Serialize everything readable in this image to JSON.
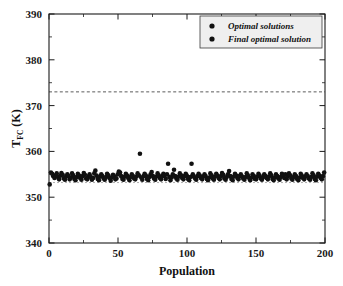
{
  "chart_data": {
    "type": "scatter",
    "title": "",
    "xlabel": "Population",
    "ylabel_main": "T",
    "ylabel_sub": "FC",
    "ylabel_unit": " (K)",
    "ylabel_full": "T_FC (K)",
    "xlim": [
      0,
      200
    ],
    "ylim": [
      340,
      390
    ],
    "xticks": [
      0,
      50,
      100,
      150,
      200
    ],
    "xtick_labels": [
      "0",
      "50",
      "100",
      "150",
      "200"
    ],
    "xticks_minor": [
      25,
      75,
      125,
      175
    ],
    "yticks": [
      340,
      350,
      360,
      370,
      380,
      390
    ],
    "ytick_labels": [
      "340",
      "350",
      "360",
      "370",
      "380",
      "390"
    ],
    "yticks_minor": [
      345,
      355,
      365,
      375,
      385
    ],
    "grid": false,
    "legend_position": "top-right",
    "legend": [
      {
        "label": "Optimal solutions",
        "marker": "filled-circle",
        "color": "#111111"
      },
      {
        "label": "Final optimal solution",
        "marker": "filled-circle",
        "color": "#111111"
      }
    ],
    "reference_lines": [
      {
        "name": "upper-constraint",
        "y": 373.0,
        "style": "dashed",
        "color": "#4a4a4a"
      },
      {
        "name": "final-optimal-solution",
        "y": 353.2,
        "style": "dashed",
        "color": "#9a9a9a"
      }
    ],
    "series": [
      {
        "name": "Optimal solutions",
        "color": "#111111",
        "marker": "filled-circle",
        "points": [
          [
            0.5,
            352.8
          ],
          [
            1.4,
            355.4
          ],
          [
            2.3,
            355.1
          ],
          [
            3.1,
            354.6
          ],
          [
            4.0,
            354.2
          ],
          [
            4.8,
            354.8
          ],
          [
            5.6,
            355.2
          ],
          [
            6.5,
            354.4
          ],
          [
            7.3,
            353.9
          ],
          [
            8.2,
            354.7
          ],
          [
            9.0,
            355.3
          ],
          [
            9.9,
            354.9
          ],
          [
            10.7,
            354.1
          ],
          [
            11.6,
            353.8
          ],
          [
            12.4,
            354.5
          ],
          [
            13.3,
            355.0
          ],
          [
            14.1,
            354.6
          ],
          [
            15.0,
            353.9
          ],
          [
            15.8,
            354.3
          ],
          [
            16.7,
            355.2
          ],
          [
            17.5,
            354.8
          ],
          [
            18.4,
            354.0
          ],
          [
            19.2,
            353.7
          ],
          [
            20.1,
            354.4
          ],
          [
            20.9,
            355.1
          ],
          [
            21.8,
            354.7
          ],
          [
            22.6,
            354.2
          ],
          [
            23.5,
            353.8
          ],
          [
            24.3,
            354.6
          ],
          [
            25.2,
            355.3
          ],
          [
            26.0,
            354.9
          ],
          [
            26.9,
            354.1
          ],
          [
            27.7,
            353.9
          ],
          [
            28.6,
            354.5
          ],
          [
            29.4,
            355.0
          ],
          [
            30.3,
            354.4
          ],
          [
            31.1,
            353.8
          ],
          [
            32.0,
            354.2
          ],
          [
            32.8,
            355.2
          ],
          [
            33.6,
            355.8
          ],
          [
            34.5,
            354.7
          ],
          [
            35.3,
            354.0
          ],
          [
            36.2,
            353.7
          ],
          [
            37.0,
            354.5
          ],
          [
            37.9,
            355.0
          ],
          [
            38.7,
            354.6
          ],
          [
            39.6,
            354.1
          ],
          [
            40.4,
            353.8
          ],
          [
            41.3,
            354.4
          ],
          [
            42.1,
            355.1
          ],
          [
            43.0,
            354.8
          ],
          [
            43.8,
            354.2
          ],
          [
            44.7,
            353.6
          ],
          [
            45.5,
            354.3
          ],
          [
            46.4,
            354.9
          ],
          [
            47.2,
            354.5
          ],
          [
            48.1,
            353.9
          ],
          [
            48.9,
            354.1
          ],
          [
            49.8,
            355.0
          ],
          [
            50.6,
            355.6
          ],
          [
            51.5,
            355.4
          ],
          [
            52.3,
            354.6
          ],
          [
            53.2,
            354.0
          ],
          [
            54.0,
            353.8
          ],
          [
            54.9,
            354.5
          ],
          [
            55.7,
            355.1
          ],
          [
            56.6,
            354.7
          ],
          [
            57.4,
            354.2
          ],
          [
            58.3,
            353.7
          ],
          [
            59.1,
            354.4
          ],
          [
            60.0,
            355.0
          ],
          [
            60.8,
            354.6
          ],
          [
            61.7,
            354.1
          ],
          [
            62.5,
            353.9
          ],
          [
            63.4,
            354.5
          ],
          [
            64.2,
            355.2
          ],
          [
            65.1,
            354.8
          ],
          [
            65.9,
            359.5
          ],
          [
            66.8,
            354.3
          ],
          [
            67.6,
            353.8
          ],
          [
            68.5,
            354.6
          ],
          [
            69.3,
            355.1
          ],
          [
            70.2,
            354.7
          ],
          [
            71.0,
            354.0
          ],
          [
            71.9,
            353.7
          ],
          [
            72.7,
            354.4
          ],
          [
            73.6,
            355.0
          ],
          [
            74.4,
            355.5
          ],
          [
            75.3,
            354.6
          ],
          [
            76.1,
            354.1
          ],
          [
            77.0,
            353.8
          ],
          [
            77.8,
            354.5
          ],
          [
            78.7,
            355.2
          ],
          [
            79.5,
            354.8
          ],
          [
            80.4,
            354.2
          ],
          [
            81.2,
            353.9
          ],
          [
            82.1,
            354.6
          ],
          [
            82.9,
            355.1
          ],
          [
            83.8,
            354.7
          ],
          [
            84.6,
            354.0
          ],
          [
            85.5,
            355.0
          ],
          [
            86.3,
            357.3
          ],
          [
            87.2,
            354.4
          ],
          [
            88.0,
            353.7
          ],
          [
            88.9,
            354.3
          ],
          [
            89.7,
            355.0
          ],
          [
            90.6,
            356.0
          ],
          [
            91.4,
            354.6
          ],
          [
            92.3,
            354.1
          ],
          [
            93.1,
            353.8
          ],
          [
            94.0,
            354.5
          ],
          [
            94.8,
            355.2
          ],
          [
            95.7,
            354.8
          ],
          [
            96.5,
            354.2
          ],
          [
            97.4,
            353.9
          ],
          [
            98.2,
            354.6
          ],
          [
            99.1,
            355.1
          ],
          [
            99.9,
            354.7
          ],
          [
            100.8,
            354.0
          ],
          [
            101.6,
            353.7
          ],
          [
            102.5,
            354.4
          ],
          [
            103.3,
            357.3
          ],
          [
            104.2,
            355.0
          ],
          [
            105.0,
            354.5
          ],
          [
            105.9,
            354.1
          ],
          [
            106.7,
            353.8
          ],
          [
            107.6,
            354.6
          ],
          [
            108.4,
            355.1
          ],
          [
            109.3,
            354.7
          ],
          [
            110.1,
            354.2
          ],
          [
            111.0,
            353.9
          ],
          [
            111.8,
            354.5
          ],
          [
            112.7,
            355.0
          ],
          [
            113.5,
            354.6
          ],
          [
            114.4,
            354.0
          ],
          [
            115.2,
            353.7
          ],
          [
            116.1,
            354.3
          ],
          [
            116.9,
            355.2
          ],
          [
            117.8,
            354.8
          ],
          [
            118.6,
            354.1
          ],
          [
            119.5,
            353.8
          ],
          [
            120.3,
            354.5
          ],
          [
            121.2,
            355.1
          ],
          [
            122.0,
            354.7
          ],
          [
            122.9,
            354.2
          ],
          [
            123.7,
            353.9
          ],
          [
            124.6,
            354.6
          ],
          [
            125.4,
            355.3
          ],
          [
            126.3,
            354.9
          ],
          [
            127.1,
            354.1
          ],
          [
            128.0,
            353.8
          ],
          [
            128.8,
            354.4
          ],
          [
            129.7,
            355.0
          ],
          [
            130.5,
            355.7
          ],
          [
            131.4,
            354.6
          ],
          [
            132.2,
            354.0
          ],
          [
            133.1,
            353.7
          ],
          [
            133.9,
            354.5
          ],
          [
            134.8,
            355.1
          ],
          [
            135.6,
            354.7
          ],
          [
            136.5,
            354.2
          ],
          [
            137.3,
            353.9
          ],
          [
            138.2,
            354.6
          ],
          [
            139.0,
            355.0
          ],
          [
            139.9,
            354.5
          ],
          [
            140.7,
            354.1
          ],
          [
            141.6,
            353.8
          ],
          [
            142.4,
            354.4
          ],
          [
            143.3,
            355.2
          ],
          [
            144.1,
            354.8
          ],
          [
            145.0,
            354.2
          ],
          [
            145.8,
            353.7
          ],
          [
            146.7,
            354.3
          ],
          [
            147.5,
            355.0
          ],
          [
            148.4,
            354.6
          ],
          [
            149.2,
            354.0
          ],
          [
            150.1,
            353.9
          ],
          [
            150.9,
            354.5
          ],
          [
            151.8,
            355.1
          ],
          [
            152.6,
            354.7
          ],
          [
            153.5,
            354.1
          ],
          [
            154.3,
            353.8
          ],
          [
            155.2,
            354.4
          ],
          [
            156.0,
            355.0
          ],
          [
            156.9,
            354.6
          ],
          [
            157.7,
            354.2
          ],
          [
            158.6,
            353.9
          ],
          [
            159.4,
            354.5
          ],
          [
            160.3,
            355.2
          ],
          [
            161.1,
            354.8
          ],
          [
            162.0,
            354.0
          ],
          [
            162.8,
            353.7
          ],
          [
            163.7,
            354.3
          ],
          [
            164.5,
            355.0
          ],
          [
            165.4,
            354.6
          ],
          [
            166.2,
            354.1
          ],
          [
            167.1,
            353.8
          ],
          [
            167.9,
            354.4
          ],
          [
            168.8,
            355.1
          ],
          [
            169.6,
            354.7
          ],
          [
            170.5,
            354.2
          ],
          [
            171.3,
            355.0
          ],
          [
            172.2,
            353.9
          ],
          [
            173.0,
            354.5
          ],
          [
            173.9,
            355.2
          ],
          [
            174.7,
            354.8
          ],
          [
            175.6,
            354.1
          ],
          [
            176.4,
            353.8
          ],
          [
            177.3,
            354.4
          ],
          [
            178.1,
            355.0
          ],
          [
            179.0,
            354.6
          ],
          [
            179.8,
            354.0
          ],
          [
            180.7,
            353.7
          ],
          [
            181.5,
            354.3
          ],
          [
            182.4,
            355.1
          ],
          [
            183.2,
            354.7
          ],
          [
            184.1,
            354.2
          ],
          [
            184.9,
            353.9
          ],
          [
            185.8,
            354.5
          ],
          [
            186.6,
            355.0
          ],
          [
            187.5,
            354.6
          ],
          [
            188.3,
            354.1
          ],
          [
            189.2,
            353.8
          ],
          [
            190.0,
            354.4
          ],
          [
            190.9,
            355.2
          ],
          [
            191.7,
            354.8
          ],
          [
            192.6,
            354.0
          ],
          [
            193.4,
            353.7
          ],
          [
            194.3,
            354.5
          ],
          [
            195.1,
            355.1
          ],
          [
            196.0,
            354.7
          ],
          [
            196.8,
            354.2
          ],
          [
            197.7,
            353.9
          ],
          [
            198.5,
            354.6
          ],
          [
            199.4,
            355.4
          ]
        ]
      }
    ]
  }
}
